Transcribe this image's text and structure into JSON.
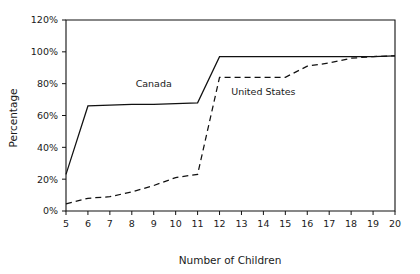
{
  "chart_data": {
    "type": "line",
    "title": "",
    "subtitle": "",
    "xlabel": "Number of Children",
    "ylabel": "Percentage",
    "x": [
      5,
      6,
      7,
      8,
      9,
      10,
      11,
      12,
      13,
      14,
      15,
      16,
      17,
      18,
      19,
      20
    ],
    "xlim": [
      5,
      20
    ],
    "ylim": [
      0,
      120
    ],
    "xtick_labels": [
      "5",
      "6",
      "7",
      "8",
      "9",
      "10",
      "11",
      "12",
      "13",
      "14",
      "15",
      "16",
      "17",
      "18",
      "19",
      "20"
    ],
    "ytick_values": [
      0,
      20,
      40,
      60,
      80,
      100,
      120
    ],
    "ytick_labels": [
      "0%",
      "20%",
      "40%",
      "60%",
      "80%",
      "100%",
      "120%"
    ],
    "grid": false,
    "legend_position": "inline-annotation",
    "series": [
      {
        "name": "Canada",
        "style": "solid",
        "color": "#111111",
        "values": [
          23,
          66,
          66.5,
          67,
          67,
          67.5,
          68,
          97,
          97,
          97,
          97,
          97,
          97,
          97,
          97,
          97.5
        ]
      },
      {
        "name": "United States",
        "style": "dashed",
        "color": "#111111",
        "values": [
          4.5,
          8,
          9,
          12,
          16,
          21,
          23,
          84,
          84,
          84,
          84,
          91,
          93,
          96,
          97,
          97.5
        ]
      }
    ],
    "annotations": [
      {
        "text": "Canada",
        "x": 9.0,
        "y": 78
      },
      {
        "text": "United States",
        "x": 14.0,
        "y": 73
      }
    ]
  },
  "colors": {
    "background": "#ffffff",
    "axis": "#111111",
    "text": "#1a1a1a",
    "series": "#111111"
  }
}
